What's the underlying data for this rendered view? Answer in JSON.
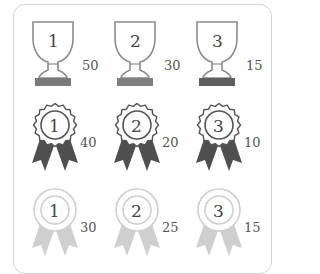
{
  "colors": {
    "trophy_outline": "#8a8a8a",
    "trophy_base": [
      "#7a7a7a",
      "#7f7f7f",
      "#5e5e5e"
    ],
    "ribbon_dark": "#4f4f4f",
    "ribbon_light": "#cfcfcf",
    "frame": "#d4d4d4"
  },
  "rows": [
    {
      "type": "trophy",
      "items": [
        {
          "rank": "1",
          "score": "50"
        },
        {
          "rank": "2",
          "score": "30"
        },
        {
          "rank": "3",
          "score": "15"
        }
      ]
    },
    {
      "type": "rosette-dark",
      "items": [
        {
          "rank": "1",
          "score": "40"
        },
        {
          "rank": "2",
          "score": "20"
        },
        {
          "rank": "3",
          "score": "10"
        }
      ]
    },
    {
      "type": "rosette-light",
      "items": [
        {
          "rank": "1",
          "score": "30"
        },
        {
          "rank": "2",
          "score": "25"
        },
        {
          "rank": "3",
          "score": "15"
        }
      ]
    }
  ]
}
